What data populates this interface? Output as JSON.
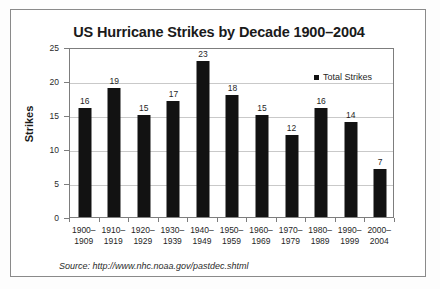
{
  "chart_data": {
    "type": "bar",
    "title": "US Hurricane Strikes by Decade 1900–2004",
    "xlabel": "",
    "ylabel": "Strikes",
    "categories": [
      "1900– 1909",
      "1910– 1919",
      "1920– 1929",
      "1930– 1939",
      "1940– 1949",
      "1950– 1959",
      "1960– 1969",
      "1970– 1979",
      "1980– 1989",
      "1990– 1999",
      "2000– 2004"
    ],
    "category_lines": [
      [
        "1900–",
        "1909"
      ],
      [
        "1910–",
        "1919"
      ],
      [
        "1920–",
        "1929"
      ],
      [
        "1930–",
        "1939"
      ],
      [
        "1940–",
        "1949"
      ],
      [
        "1950–",
        "1959"
      ],
      [
        "1960–",
        "1969"
      ],
      [
        "1970–",
        "1979"
      ],
      [
        "1980–",
        "1989"
      ],
      [
        "1990–",
        "1999"
      ],
      [
        "2000–",
        "2004"
      ]
    ],
    "values": [
      16,
      19,
      15,
      17,
      23,
      18,
      15,
      12,
      16,
      14,
      7
    ],
    "series": [
      {
        "name": "Total Strikes",
        "values": [
          16,
          19,
          15,
          17,
          23,
          18,
          15,
          12,
          16,
          14,
          7
        ],
        "color": "#121212"
      }
    ],
    "ylim": [
      0,
      25
    ],
    "yticks": [
      0,
      5,
      10,
      15,
      20,
      25
    ],
    "ytick_labels": [
      "0",
      "5",
      "10",
      "15",
      "20",
      "25"
    ],
    "grid": true,
    "grid_axis": "y",
    "grid_color": "#c9c9c9",
    "data_labels": true,
    "legend": {
      "position": "top-right",
      "entries": [
        {
          "label": "Total Strikes",
          "color": "#121212",
          "marker": "square"
        }
      ]
    },
    "bar_color": "#121212",
    "plot_border_color": "#7d7d7d",
    "background": "#ffffff"
  },
  "source": {
    "text": "Source: http://www.nhc.noaa.gov/pastdec.shtml"
  },
  "frame": {
    "border_color": "#8a8a8a"
  }
}
